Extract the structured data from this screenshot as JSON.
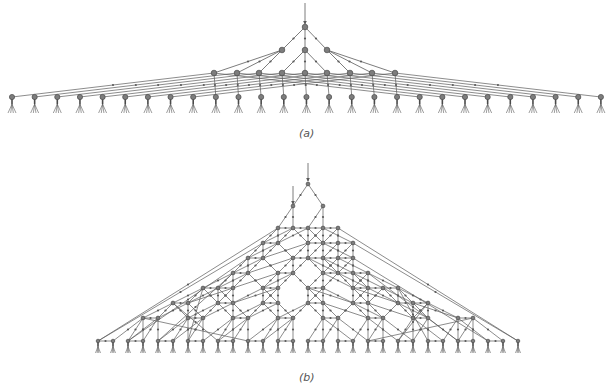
{
  "colors": {
    "edge": "#5a5a5a",
    "node": "#7d7d7d",
    "node_stroke": "#4a4a4a",
    "caption": "#555555"
  },
  "figure_a": {
    "caption": "(a)",
    "caption_pos": [
      299,
      127
    ],
    "input_arrow": {
      "from": [
        305,
        3
      ],
      "to": [
        305,
        24
      ]
    },
    "root": [
      305,
      27
    ],
    "level1": [
      [
        282,
        50
      ],
      [
        305,
        50
      ],
      [
        327,
        50
      ]
    ],
    "level2": [
      [
        214,
        73
      ],
      [
        237,
        73
      ],
      [
        259,
        73
      ],
      [
        282,
        73
      ],
      [
        305,
        73
      ],
      [
        327,
        73
      ],
      [
        350,
        73
      ],
      [
        372,
        73
      ],
      [
        395,
        73
      ]
    ],
    "leaf_y": 97,
    "leaf_x_start": 12,
    "leaf_spacing": 22.65,
    "leaf_count": 27
  },
  "figure_b": {
    "caption": "(b)",
    "caption_pos": [
      299,
      371
    ],
    "input_arrows": [
      {
        "from": [
          308,
          163
        ],
        "to": [
          308,
          181
        ]
      },
      {
        "from": [
          293,
          186
        ],
        "to": [
          293,
          204
        ]
      }
    ],
    "root": [
      308,
      184
    ],
    "layers": [
      {
        "y": 184,
        "x": [
          308
        ]
      },
      {
        "y": 206,
        "x": [
          293,
          323
        ]
      },
      {
        "y": 228,
        "x": [
          278,
          293,
          308,
          323,
          338
        ]
      },
      {
        "y": 243,
        "x": [
          263,
          278,
          308,
          323,
          338,
          353
        ]
      },
      {
        "y": 258,
        "x": [
          248,
          263,
          293,
          308,
          323,
          338,
          353
        ]
      },
      {
        "y": 273,
        "x": [
          233,
          248,
          278,
          293,
          323,
          338,
          353,
          368
        ]
      },
      {
        "y": 288,
        "x": [
          203,
          218,
          233,
          263,
          278,
          308,
          323,
          353,
          368,
          383,
          398
        ]
      },
      {
        "y": 303,
        "x": [
          173,
          188,
          218,
          233,
          263,
          278,
          308,
          323,
          353,
          368,
          398,
          413,
          428
        ]
      },
      {
        "y": 318,
        "x": [
          143,
          158,
          188,
          203,
          233,
          248,
          278,
          293,
          323,
          338,
          368,
          383,
          413,
          428,
          458,
          473
        ]
      },
      {
        "y": 341,
        "x": [
          98,
          113,
          128,
          143,
          158,
          173,
          188,
          203,
          218,
          233,
          248,
          263,
          278,
          293,
          308,
          323,
          338,
          353,
          368,
          383,
          398,
          413,
          428,
          443,
          458,
          473,
          488,
          503,
          518
        ]
      }
    ]
  }
}
